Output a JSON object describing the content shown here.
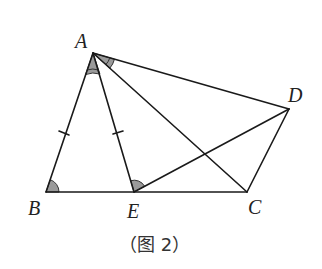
{
  "figure": {
    "caption": "（图 2）",
    "points": {
      "A": {
        "label": "A",
        "x": 93,
        "y": 53
      },
      "B": {
        "label": "B",
        "x": 46,
        "y": 192
      },
      "E": {
        "label": "E",
        "x": 134,
        "y": 192
      },
      "C": {
        "label": "C",
        "x": 247,
        "y": 192
      },
      "D": {
        "label": "D",
        "x": 289,
        "y": 109
      }
    },
    "segments": [
      "AB",
      "AE",
      "AC",
      "AD",
      "BC",
      "CD",
      "ED"
    ],
    "equal_marks": [
      "AB",
      "AE"
    ],
    "marked_angles": [
      "ABC",
      "BAE",
      "CAD",
      "AED"
    ],
    "colors": {
      "line": "#1a1a1a",
      "angle_fill": "#9a9a9a"
    }
  }
}
